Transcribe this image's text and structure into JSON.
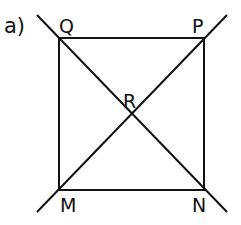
{
  "header_fragment": "g",
  "part_label": "a)",
  "figure": {
    "type": "square with diagonals",
    "line_color": "#111111",
    "vertices": {
      "Q": {
        "label": "Q",
        "x": 59,
        "y": 38
      },
      "P": {
        "label": "P",
        "x": 204,
        "y": 38
      },
      "M": {
        "label": "M",
        "x": 59,
        "y": 190
      },
      "N": {
        "label": "N",
        "x": 204,
        "y": 190
      }
    },
    "intersection": {
      "label": "R",
      "x": 131,
      "y": 114
    },
    "diagonals": [
      {
        "name": "QN",
        "extended_from": [
          37,
          15
        ],
        "extended_to": [
          227,
          212
        ]
      },
      {
        "name": "MP",
        "extended_from": [
          37,
          212
        ],
        "extended_to": [
          227,
          15
        ]
      }
    ]
  }
}
